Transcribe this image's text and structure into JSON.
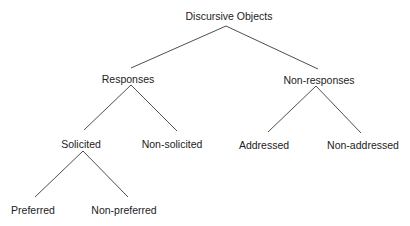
{
  "diagram": {
    "type": "tree",
    "root": {
      "label": "Discursive Objects",
      "children": [
        {
          "label": "Responses",
          "children": [
            {
              "label": "Solicited",
              "children": [
                {
                  "label": "Preferred"
                },
                {
                  "label": "Non-preferred"
                }
              ]
            },
            {
              "label": "Non-solicited"
            }
          ]
        },
        {
          "label": "Non-responses",
          "children": [
            {
              "label": "Addressed"
            },
            {
              "label": "Non-addressed"
            }
          ]
        }
      ]
    }
  },
  "nodes": {
    "discursive_objects": "Discursive Objects",
    "responses": "Responses",
    "non_responses": "Non-responses",
    "solicited": "Solicited",
    "non_solicited": "Non-solicited",
    "addressed": "Addressed",
    "non_addressed": "Non-addressed",
    "preferred": "Preferred",
    "non_preferred": "Non-preferred"
  },
  "colors": {
    "line": "#3a3a3a",
    "text": "#222222",
    "background": "#ffffff"
  }
}
